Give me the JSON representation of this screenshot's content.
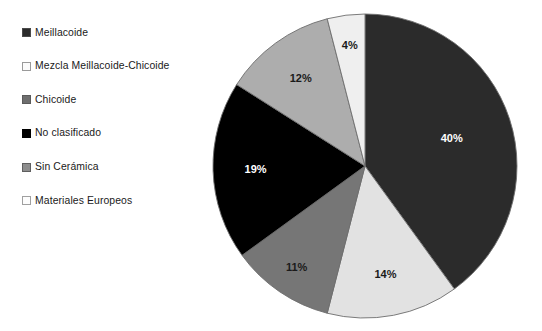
{
  "figure": {
    "background_color": "#ffffff",
    "type": "pie-chart-figure"
  },
  "legend": {
    "position": "left",
    "items": [
      {
        "label": "Meillacoide",
        "color": "#2b2b2b",
        "border_color": "#4a4a4a"
      },
      {
        "label": "Mezcla Meillacoide-Chicoide",
        "color": "#fbfbfb",
        "border_color": "#9a9a9a"
      },
      {
        "label": "Chicoide",
        "color": "#6e6e6e",
        "border_color": "#5a5a5a"
      },
      {
        "label": "No clasificado",
        "color": "#000000",
        "border_color": "#000000"
      },
      {
        "label": "Sin Cerámica",
        "color": "#8d8d8d",
        "border_color": "#5f5f5f"
      },
      {
        "label": "Materiales Europeos",
        "color": "#fdfdfd",
        "border_color": "#a0a0a0"
      }
    ]
  },
  "chart_data": {
    "type": "pie",
    "title": "",
    "subtitle": "",
    "xlabel": "",
    "ylabel": "",
    "grid": false,
    "legend_position": "left",
    "start_angle_deg": 0,
    "direction": "clockwise",
    "total_percent": 100,
    "center": {
      "x": 365,
      "y": 166
    },
    "radius": 155,
    "categories": [
      "Meillacoide",
      "Mezcla Meillacoide-Chicoide",
      "Chicoide",
      "No clasificado",
      "Sin Cerámica",
      "Materiales Europeos"
    ],
    "values": [
      40,
      14,
      11,
      19,
      12,
      4
    ],
    "labels": [
      "40%",
      "14%",
      "11%",
      "19%",
      "12%",
      "4%"
    ],
    "colors": [
      "#2b2b2b",
      "#e2e2e2",
      "#767676",
      "#000000",
      "#adadad",
      "#efefef"
    ],
    "label_colors": [
      "#ffffff",
      "#1a1a1a",
      "#1a1a1a",
      "#ffffff",
      "#1a1a1a",
      "#1a1a1a"
    ],
    "slices": [
      {
        "name": "Meillacoide",
        "value": 40,
        "label": "40%",
        "color": "#2b2b2b",
        "label_color": "#ffffff"
      },
      {
        "name": "Mezcla Meillacoide-Chicoide",
        "value": 14,
        "label": "14%",
        "color": "#e2e2e2",
        "label_color": "#1a1a1a"
      },
      {
        "name": "Chicoide",
        "value": 11,
        "label": "11%",
        "color": "#767676",
        "label_color": "#1a1a1a"
      },
      {
        "name": "No clasificado",
        "value": 19,
        "label": "19%",
        "color": "#000000",
        "label_color": "#ffffff"
      },
      {
        "name": "Sin Cerámica",
        "value": 12,
        "label": "12%",
        "color": "#adadad",
        "label_color": "#1a1a1a"
      },
      {
        "name": "Materiales Europeos",
        "value": 4,
        "label": "4%",
        "color": "#efefef",
        "label_color": "#1a1a1a"
      }
    ],
    "outline_color": "#6d6d6d"
  }
}
